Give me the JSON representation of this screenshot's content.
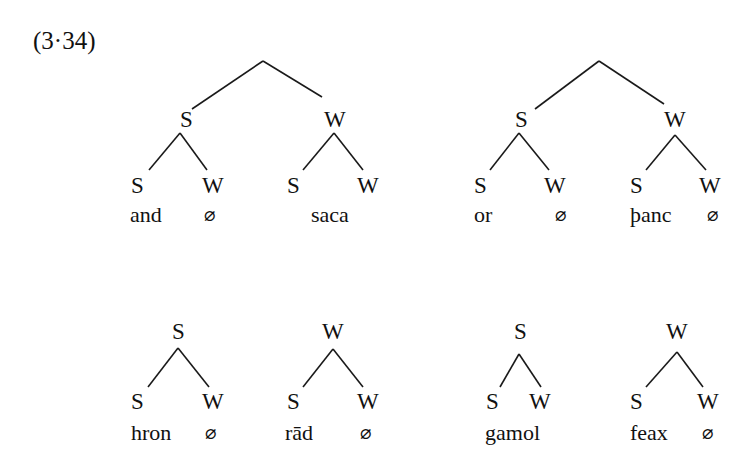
{
  "example_label": "(3·34)",
  "trees": [
    {
      "id": "and-saca",
      "root": "",
      "children": [
        {
          "label": "S",
          "children": [
            {
              "label": "S",
              "word": "and"
            },
            {
              "label": "W",
              "word": "∅"
            }
          ]
        },
        {
          "label": "W",
          "children": [
            {
              "label": "S"
            },
            {
              "label": "W"
            }
          ],
          "word": "saca"
        }
      ]
    },
    {
      "id": "or-panc",
      "root": "",
      "children": [
        {
          "label": "S",
          "children": [
            {
              "label": "S",
              "word": "or"
            },
            {
              "label": "W",
              "word": "∅"
            }
          ]
        },
        {
          "label": "W",
          "children": [
            {
              "label": "S",
              "word": "þanc"
            },
            {
              "label": "W",
              "word": "∅"
            }
          ]
        }
      ]
    },
    {
      "id": "hron",
      "root": "S",
      "children": [
        {
          "label": "S",
          "word": "hron"
        },
        {
          "label": "W",
          "word": "∅"
        }
      ]
    },
    {
      "id": "rad",
      "root": "W",
      "children": [
        {
          "label": "S",
          "word": "rād"
        },
        {
          "label": "W",
          "word": "∅"
        }
      ]
    },
    {
      "id": "gamol",
      "root": "S",
      "children": [
        {
          "label": "S"
        },
        {
          "label": "W"
        }
      ],
      "word": "gamol"
    },
    {
      "id": "feax",
      "root": "W",
      "children": [
        {
          "label": "S",
          "word": "feax"
        },
        {
          "label": "W",
          "word": "∅"
        }
      ]
    }
  ],
  "labels": {
    "S": "S",
    "W": "W",
    "null": "∅",
    "w_and": "and",
    "w_saca": "saca",
    "w_or": "or",
    "w_panc": "þanc",
    "w_hron": "hron",
    "w_rad": "rād",
    "w_gamol": "gamol",
    "w_feax": "feax"
  }
}
